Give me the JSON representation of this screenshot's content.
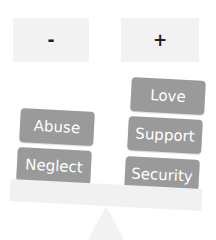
{
  "diagram": {
    "type": "balance-scale",
    "sides": {
      "negative": {
        "label": "-",
        "items": [
          "Abuse",
          "Neglect"
        ]
      },
      "positive": {
        "label": "+",
        "items": [
          "Love",
          "Support",
          "Security"
        ]
      }
    },
    "colors": {
      "block": "#9a9a9a",
      "block_text": "#ffffff",
      "sign_box": "#f2f2f2",
      "beam": "#f1f1f1"
    }
  }
}
